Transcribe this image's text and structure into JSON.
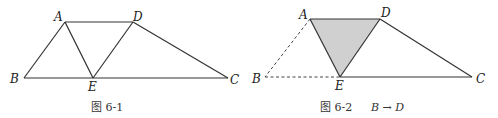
{
  "figures": [
    {
      "caption": "图 6-1",
      "points": {
        "A": {
          "label": "A",
          "x": 65,
          "y": 22
        },
        "D": {
          "label": "D",
          "x": 133,
          "y": 22
        },
        "B": {
          "label": "B",
          "x": 24,
          "y": 78
        },
        "E": {
          "label": "E",
          "x": 93,
          "y": 78
        },
        "C": {
          "label": "C",
          "x": 228,
          "y": 78
        }
      },
      "segments": [
        "AD",
        "AB",
        "AE",
        "DE",
        "DC",
        "BC"
      ]
    },
    {
      "caption_prefix": "图 6-2",
      "caption_math": "B → D",
      "points": {
        "A": {
          "label": "A",
          "x": 310,
          "y": 19
        },
        "D": {
          "label": "D",
          "x": 380,
          "y": 19
        },
        "B": {
          "label": "B",
          "x": 265,
          "y": 77
        },
        "E": {
          "label": "E",
          "x": 340,
          "y": 77
        },
        "C": {
          "label": "C",
          "x": 472,
          "y": 77
        }
      },
      "solid_segments": [
        "AD",
        "AE",
        "DE",
        "DC",
        "EC"
      ],
      "dashed_segments": [
        "AB",
        "BE"
      ],
      "shaded_triangle": "ADE",
      "shade_color": "#d0d0d0"
    }
  ]
}
